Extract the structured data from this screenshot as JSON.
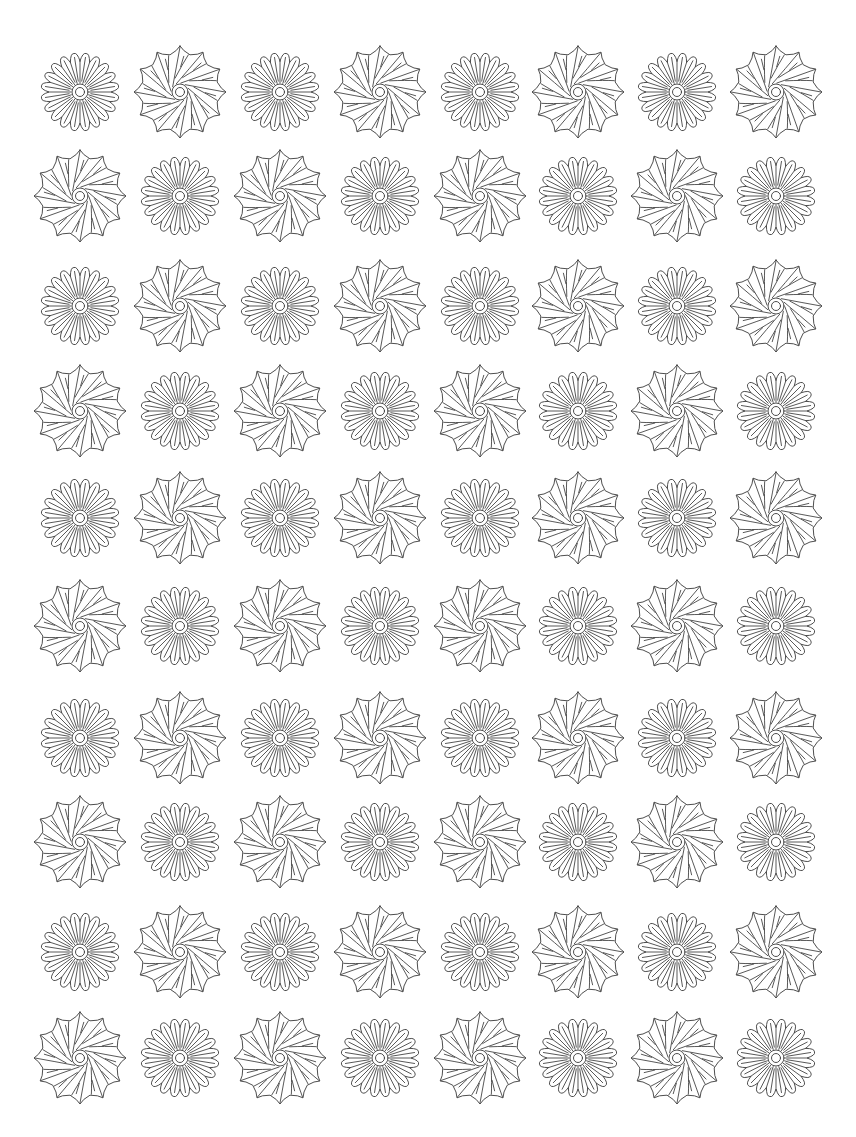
{
  "page": {
    "title": "Flower pattern coloring page",
    "width": 856,
    "height": 1137,
    "background": "#ffffff",
    "stroke_color": "#3a3a3a"
  },
  "grid": {
    "rows": 10,
    "cols": 8,
    "col_centers_x": [
      80,
      180,
      280,
      380,
      480,
      578,
      677,
      776
    ],
    "row_centers_y": [
      92,
      196,
      306,
      411,
      518,
      626,
      738,
      842,
      952,
      1058
    ],
    "pattern": "checkerboard",
    "layout": [
      [
        "radial",
        "swirl",
        "radial",
        "swirl",
        "radial",
        "swirl",
        "radial",
        "swirl"
      ],
      [
        "swirl",
        "radial",
        "swirl",
        "radial",
        "swirl",
        "radial",
        "swirl",
        "radial"
      ],
      [
        "radial",
        "swirl",
        "radial",
        "swirl",
        "radial",
        "swirl",
        "radial",
        "swirl"
      ],
      [
        "swirl",
        "radial",
        "swirl",
        "radial",
        "swirl",
        "radial",
        "swirl",
        "radial"
      ],
      [
        "radial",
        "swirl",
        "radial",
        "swirl",
        "radial",
        "swirl",
        "radial",
        "swirl"
      ],
      [
        "swirl",
        "radial",
        "swirl",
        "radial",
        "swirl",
        "radial",
        "swirl",
        "radial"
      ],
      [
        "radial",
        "swirl",
        "radial",
        "swirl",
        "radial",
        "swirl",
        "radial",
        "swirl"
      ],
      [
        "swirl",
        "radial",
        "swirl",
        "radial",
        "swirl",
        "radial",
        "swirl",
        "radial"
      ],
      [
        "radial",
        "swirl",
        "radial",
        "swirl",
        "radial",
        "swirl",
        "radial",
        "swirl"
      ],
      [
        "swirl",
        "radial",
        "swirl",
        "radial",
        "swirl",
        "radial",
        "swirl",
        "radial"
      ]
    ]
  },
  "flower_types": {
    "radial": {
      "name": "radial daisy flower",
      "petal_count": 20,
      "outer_radius": 39,
      "valley_radius": 31,
      "center_outer_radius": 8,
      "center_inner_radius": 4.5
    },
    "swirl": {
      "name": "swirl pinwheel flower",
      "point_count": 12,
      "outer_radius": 46,
      "valley_radius": 37,
      "center_outer_radius": 8,
      "center_inner_radius": 4.5
    }
  }
}
